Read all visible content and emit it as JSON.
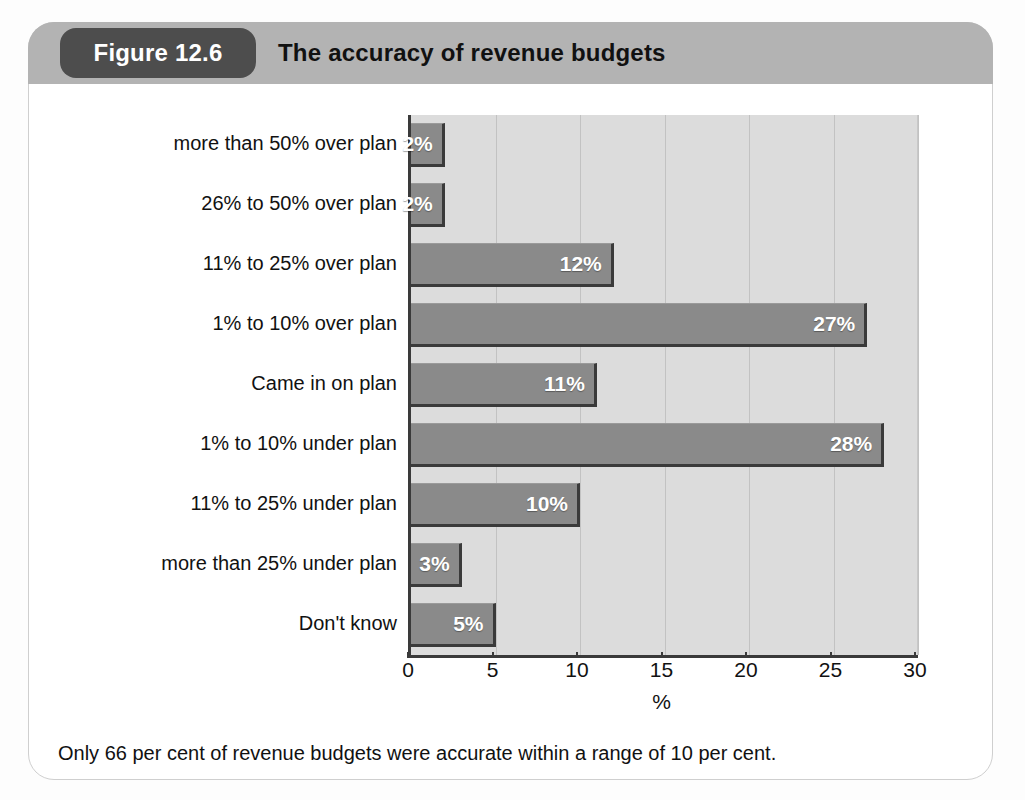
{
  "figure": {
    "badge_label": "Figure 12.6",
    "title": "The accuracy of revenue budgets",
    "caption": "Only 66 per cent of revenue budgets were accurate within a range of 10 per cent.",
    "badge_color": "#4d4d4d",
    "header_color": "#b3b3b3",
    "plot_background": "#dcdcdc",
    "bar_color": "#8a8a8a",
    "bar_shadow_color": "#3a3a3a",
    "value_label_color": "#ffffff"
  },
  "chart_data": {
    "type": "bar",
    "orientation": "horizontal",
    "title": "The accuracy of revenue budgets",
    "subtitle": "",
    "xlabel": "%",
    "ylabel": "",
    "xlim": [
      0,
      30
    ],
    "xticks": [
      0,
      5,
      10,
      15,
      20,
      25,
      30
    ],
    "xticklabels": [
      "0",
      "5",
      "10",
      "15",
      "20",
      "25",
      "30"
    ],
    "grid": "vertical",
    "legend": "none",
    "categories": [
      "more than 50% over plan",
      "26% to 50% over plan",
      "11% to 25% over plan",
      "1% to 10% over plan",
      "Came in on plan",
      "1% to 10% under plan",
      "11% to 25% under plan",
      "more than 25% under plan",
      "Don't know"
    ],
    "values": [
      2,
      2,
      12,
      27,
      11,
      28,
      10,
      3,
      5
    ],
    "data_labels": [
      "2%",
      "2%",
      "12%",
      "27%",
      "11%",
      "28%",
      "10%",
      "3%",
      "5%"
    ],
    "annotation": "Only 66 per cent of revenue budgets were accurate within a range of 10 per cent."
  }
}
